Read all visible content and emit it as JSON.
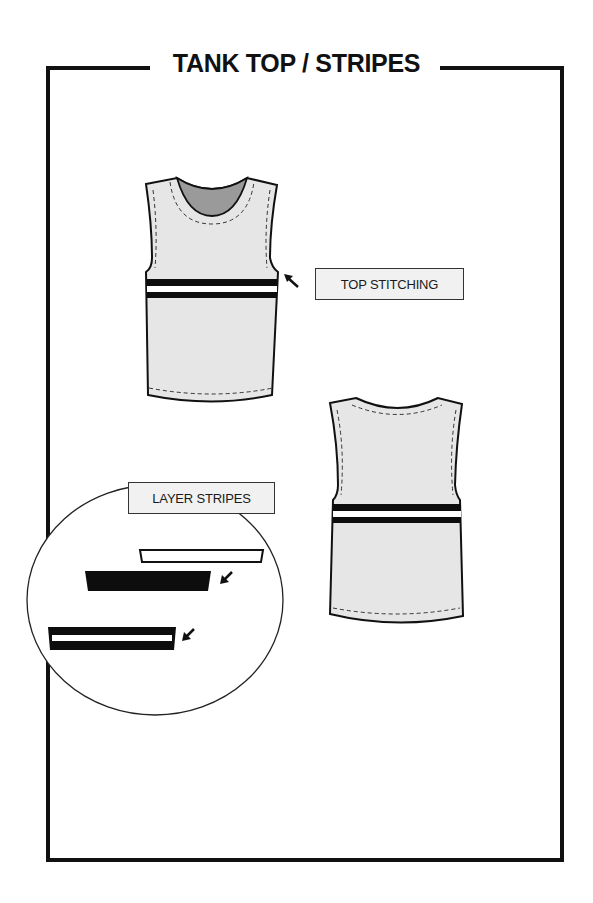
{
  "page": {
    "title": "TANK TOP / STRIPES"
  },
  "callouts": {
    "top_stitching": "TOP STITCHING",
    "layer_stripes": "LAYER STRIPES"
  },
  "garment_views": [
    {
      "view": "front",
      "feature": "double horizontal chest stripe (black / white / black)"
    },
    {
      "view": "back",
      "feature": "double horizontal chest stripe (black / white / black)"
    }
  ],
  "detail_circle": {
    "layers": [
      {
        "order": 1,
        "description": "white stripe outline"
      },
      {
        "order": 2,
        "description": "solid black stripe"
      },
      {
        "order": 3,
        "description": "assembled black stripe with white inset"
      }
    ]
  },
  "colors": {
    "outline": "#111111",
    "garment_fill": "#e6e6e6",
    "neck_lining": "#9a9a9a",
    "label_fill": "#f1f1f1",
    "stripe_dark": "#0d0d0d",
    "stripe_light": "#ffffff"
  },
  "icons": {
    "arrow": "arrow-icon"
  }
}
